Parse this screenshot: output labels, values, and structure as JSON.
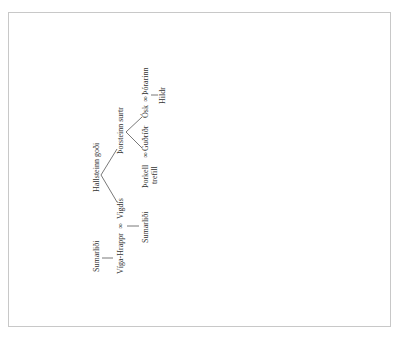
{
  "diagram": {
    "type": "family-tree",
    "orientation": "rotated-90-ccw",
    "nodes": {
      "hallsteinn": "Hallsteinn goði",
      "thorsteinn": "Þorsteinn surtr",
      "vigdis": "Vigdís",
      "viga_hrappr": "Víga-Hrappr",
      "marriage_symbol": "∞",
      "sumarlidi_1": "Sumarliði",
      "sumarlidi_2": "Sumarliði",
      "thorkell": "Þorkell",
      "thorkell_epithet": "trefill",
      "gudridr": "Guðríðr",
      "osk": "Ósk",
      "thorarinn": "Þórarinn",
      "hildr": "Hildr"
    },
    "couples": [
      {
        "a": "Víga-Hrappr",
        "b": "Vigdís"
      },
      {
        "a": "Þorkell trefill",
        "b": "Guðríðr"
      },
      {
        "a": "Ósk",
        "b": "Þórarinn"
      }
    ],
    "edges": [
      {
        "from": "Hallsteinn goði",
        "to": "Vigdís"
      },
      {
        "from": "Hallsteinn goði",
        "to": "Þorsteinn surtr"
      },
      {
        "from": "Þorsteinn surtr",
        "to": "Guðríðr"
      },
      {
        "from": "Þorsteinn surtr",
        "to": "Ósk"
      },
      {
        "from": "Sumarliði",
        "to": "Víga-Hrappr"
      },
      {
        "from": "Víga-Hrappr ∞ Vigdís",
        "to": "Sumarliði"
      },
      {
        "from": "Ósk ∞ Þórarinn",
        "to": "Hildr"
      }
    ]
  }
}
